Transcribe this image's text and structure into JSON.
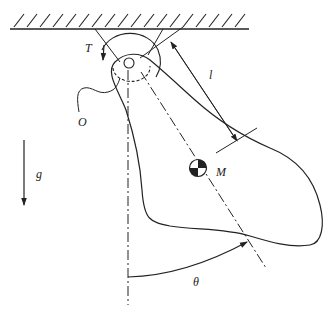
{
  "diagram": {
    "labels": {
      "torque": "T",
      "length": "l",
      "origin": "O",
      "mass": "M",
      "gravity": "g",
      "angle": "θ"
    },
    "colors": {
      "stroke": "#222222",
      "background": "#ffffff"
    }
  }
}
